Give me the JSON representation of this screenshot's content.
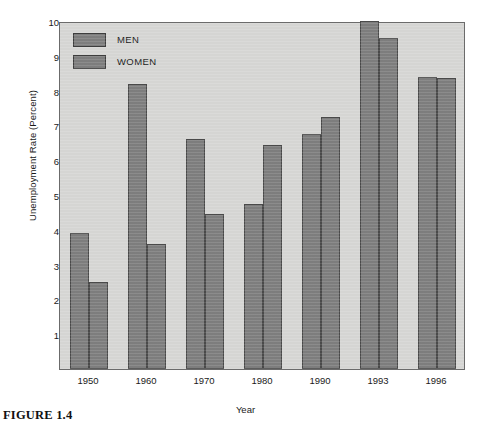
{
  "figure": {
    "label": "FIGURE 1.4",
    "caption_text": ""
  },
  "chart_data": {
    "type": "bar",
    "title": "",
    "subtitle": "",
    "xlabel": "Year",
    "ylabel": "Unemployment Rate (Percent)",
    "categories": [
      "1950",
      "1960",
      "1970",
      "1980",
      "1990",
      "1993",
      "1996"
    ],
    "series": [
      {
        "name": "MEN",
        "values": [
          3.9,
          8.2,
          6.6,
          4.75,
          6.75,
          10.0,
          8.4
        ]
      },
      {
        "name": "WOMEN",
        "values": [
          2.5,
          3.6,
          4.45,
          6.45,
          7.25,
          9.5,
          8.35
        ]
      }
    ],
    "ylim": [
      0,
      10
    ],
    "yticks": [
      1,
      2,
      3,
      4,
      5,
      6,
      7,
      8,
      9,
      10
    ],
    "ytick_labels": [
      "1",
      "2",
      "3",
      "4",
      "5",
      "6",
      "7",
      "8",
      "9",
      "10"
    ],
    "grid": false,
    "legend_position": "top-left",
    "colors": {
      "bar_fill": "#7e7e7e",
      "bar_edge": "#4a4a4a",
      "plot_background": "#d6d6d4",
      "frame": "#6b6b6b",
      "text": "#1a1a1a"
    }
  }
}
